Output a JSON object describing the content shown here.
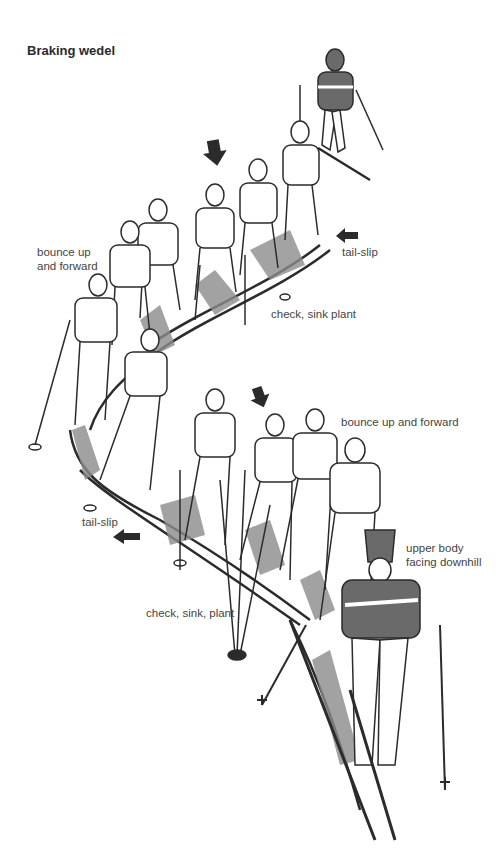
{
  "diagram": {
    "title": "Braking wedel",
    "labels": {
      "bounce_top_line1": "bounce up",
      "bounce_top_line2": "and forward",
      "tailslip_top": "tail-slip",
      "check_top": "check, sink plant",
      "bounce_bottom": "bounce up and forward",
      "tailslip_bottom": "tail-slip",
      "upper_body_line1": "upper body",
      "upper_body_line2": "facing downhill",
      "check_bottom": "check, sink, plant"
    },
    "colors": {
      "ink": "#2b2b2b",
      "sweater": "#6a6a6a",
      "snow_shading": "#8c8c8c",
      "background": "#ffffff"
    }
  }
}
